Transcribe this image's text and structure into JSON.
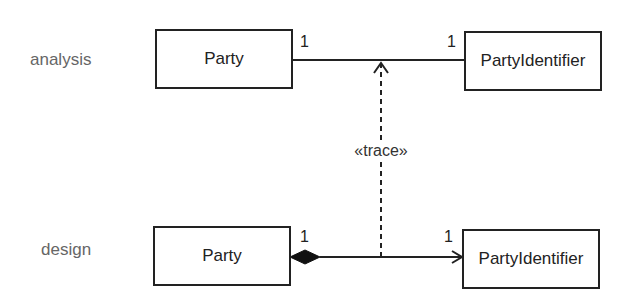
{
  "levels": {
    "analysis": "analysis",
    "design": "design"
  },
  "analysis": {
    "left_class": "Party",
    "right_class": "PartyIdentifier",
    "left_multiplicity": "1",
    "right_multiplicity": "1",
    "relationship": "association"
  },
  "design": {
    "left_class": "Party",
    "right_class": "PartyIdentifier",
    "left_multiplicity": "1",
    "right_multiplicity": "1",
    "relationship": "composition (navigable)"
  },
  "trace": {
    "label": "«trace»"
  },
  "colors": {
    "line": "#222222",
    "level_text": "#666666"
  }
}
